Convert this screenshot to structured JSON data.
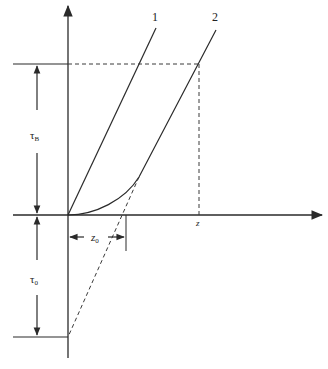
{
  "diagram": {
    "type": "shear-stress vs. strain-rate rheology diagram",
    "colors": {
      "line": "#2a2a2a",
      "dashed": "#3a3a3a",
      "background": "#ffffff"
    },
    "curves": {
      "curve1_label": "1",
      "curve2_label": "2"
    },
    "labels": {
      "tau_B_main": "τ",
      "tau_B_sub": "B",
      "tau_0_main": "τ",
      "tau_0_sub": "0",
      "z0_main": "z",
      "z0_sub": "0",
      "z_axis_point": "z"
    }
  }
}
